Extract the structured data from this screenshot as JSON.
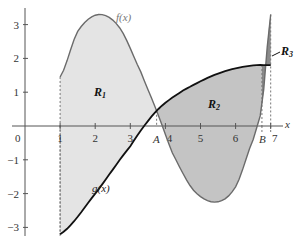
{
  "chart_data": {
    "type": "area",
    "title": "",
    "xlabel": "x",
    "ylabel": "",
    "xlim": [
      0,
      7.3
    ],
    "ylim": [
      -3.3,
      3.4
    ],
    "x_ticks": [
      "0",
      "1",
      "2",
      "3",
      "4",
      "5",
      "6",
      "7"
    ],
    "y_ticks": [
      "3",
      "2",
      "1",
      "0",
      "−1",
      "−2",
      "−3"
    ],
    "special_x_labels": [
      {
        "label": "A",
        "x": 3.75
      },
      {
        "label": "B",
        "x": 6.75
      }
    ],
    "series": [
      {
        "name": "f(x)",
        "color": "#6b6b6b",
        "points": [
          [
            1,
            1.45
          ],
          [
            1.5,
            2.8
          ],
          [
            2.1,
            3.3
          ],
          [
            2.7,
            2.9
          ],
          [
            3.3,
            1.6
          ],
          [
            3.75,
            0.45
          ],
          [
            4.2,
            -0.8
          ],
          [
            4.8,
            -1.9
          ],
          [
            5.45,
            -2.25
          ],
          [
            6.0,
            -1.8
          ],
          [
            6.5,
            -0.4
          ],
          [
            6.75,
            0.6
          ],
          [
            7.0,
            3.3
          ]
        ]
      },
      {
        "name": "g(x)",
        "color": "#111111",
        "points": [
          [
            1,
            -3.2
          ],
          [
            2,
            -2.0
          ],
          [
            3,
            -0.6
          ],
          [
            3.75,
            0.45
          ],
          [
            4.5,
            1.05
          ],
          [
            5.5,
            1.55
          ],
          [
            6.4,
            1.78
          ],
          [
            7.0,
            1.8
          ]
        ]
      }
    ],
    "regions": [
      {
        "name": "R1",
        "label": "R",
        "sub": "1",
        "from": 1,
        "to": 3.75,
        "fill": "#e4e4e4"
      },
      {
        "name": "R2",
        "label": "R",
        "sub": "2",
        "from": 3.75,
        "to": 6.75,
        "fill": "#c4c4c4"
      },
      {
        "name": "R3",
        "label": "R",
        "sub": "3",
        "from": 6.75,
        "to": 7.0,
        "fill": "#8a8a8a"
      }
    ],
    "annotations": [
      "f(x)",
      "g(x)",
      "R1",
      "R2",
      "R3",
      "A",
      "B"
    ],
    "grid": false
  },
  "labels": {
    "f": "f(x)",
    "g": "g(x)",
    "x_axis": "x",
    "A": "A",
    "B": "B",
    "R": "R",
    "r1_sub": "1",
    "r2_sub": "2",
    "r3_sub": "3"
  }
}
